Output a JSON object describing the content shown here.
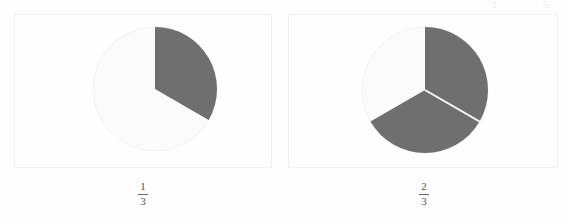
{
  "page": {
    "background_color": "#fdfdfd",
    "width": 568,
    "height": 223
  },
  "colors": {
    "shaded_slice": "#6f6f6f",
    "unshaded_slice": "#fbfbfb",
    "slice_separator": "#ffffff",
    "frame_border": "#f0f0f0",
    "label_text": "#555555",
    "fraction_rule": "#6a6a6a"
  },
  "scan_artifacts": [
    {
      "text": "1",
      "left": 492
    },
    {
      "text": "5",
      "left": 543
    }
  ],
  "figures": [
    {
      "name": "one-third",
      "frame": {
        "left": 14,
        "top": 14,
        "width": 258,
        "height": 154
      },
      "pie": {
        "cx": 140,
        "cy": 74,
        "r": 62
      },
      "label": {
        "numerator": "1",
        "denominator": "3",
        "center_x": 143,
        "top": 181
      },
      "chart_data": {
        "type": "pie",
        "title": "1/3",
        "total_slices": 3,
        "shaded_slices": 1,
        "fraction_value": 0.3333,
        "values": [
          1,
          2
        ],
        "labels": [
          "shaded",
          "unshaded"
        ],
        "slice_angles_deg": [
          120,
          240
        ],
        "start_angle_deg": 0,
        "direction": "clockwise",
        "legend": "none",
        "grid": false
      }
    },
    {
      "name": "two-thirds",
      "frame": {
        "left": 288,
        "top": 14,
        "width": 270,
        "height": 154
      },
      "pie": {
        "cx": 136,
        "cy": 75,
        "r": 63
      },
      "label": {
        "numerator": "2",
        "denominator": "3",
        "center_x": 424,
        "top": 181
      },
      "chart_data": {
        "type": "pie",
        "title": "2/3",
        "total_slices": 3,
        "shaded_slices": 2,
        "fraction_value": 0.6667,
        "values": [
          1,
          1,
          1
        ],
        "labels": [
          "shaded",
          "shaded",
          "unshaded"
        ],
        "slice_angles_deg": [
          120,
          120,
          120
        ],
        "start_angle_deg": 0,
        "direction": "clockwise",
        "legend": "none",
        "grid": false
      }
    }
  ],
  "chart_data": [
    {
      "type": "pie",
      "title": "1/3",
      "categories": [
        "shaded",
        "unshaded"
      ],
      "values": [
        1,
        2
      ],
      "fraction": "1/3",
      "fraction_value": 0.3333,
      "slice_angles_deg": [
        120,
        240
      ],
      "colors": [
        "#6f6f6f",
        "#fbfbfb"
      ],
      "legend": "none",
      "grid": false
    },
    {
      "type": "pie",
      "title": "2/3",
      "categories": [
        "shaded",
        "shaded",
        "unshaded"
      ],
      "values": [
        1,
        1,
        1
      ],
      "fraction": "2/3",
      "fraction_value": 0.6667,
      "slice_angles_deg": [
        120,
        120,
        120
      ],
      "colors": [
        "#6f6f6f",
        "#6f6f6f",
        "#fbfbfb"
      ],
      "legend": "none",
      "grid": false
    }
  ]
}
